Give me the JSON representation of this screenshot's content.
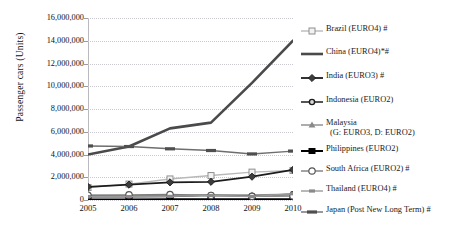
{
  "chart_data": {
    "type": "line",
    "title": "",
    "xlabel": "",
    "ylabel": "Passenger cars  (Units)",
    "x": [
      2005,
      2006,
      2007,
      2008,
      2009,
      2010
    ],
    "xtick_labels": [
      "2005",
      "2006",
      "2007",
      "2008",
      "2009",
      "2010"
    ],
    "ylim": [
      0,
      16000000
    ],
    "ytick_values": [
      0,
      2000000,
      4000000,
      6000000,
      8000000,
      10000000,
      12000000,
      14000000,
      16000000
    ],
    "ytick_labels": [
      "0",
      "2,000,000",
      "4,000,000",
      "6,000,000",
      "8,000,000",
      "10,000,000",
      "12,000,000",
      "14,000,000",
      "16,000,000"
    ],
    "grid": true,
    "legend_position": "right",
    "series": [
      {
        "name": "Brazil  (EURO4) #",
        "marker": "open-square",
        "color": "#b9b9b9",
        "line_width": 1.4,
        "values": [
          1100000,
          1400000,
          1850000,
          2150000,
          2450000,
          2600000
        ]
      },
      {
        "name": "China  (EURO4)*#",
        "marker": "none",
        "color": "#4a4a4a",
        "line_width": 2.6,
        "values": [
          4000000,
          4700000,
          6300000,
          6800000,
          10300000,
          14000000
        ]
      },
      {
        "name": "India (EURO3) #",
        "marker": "filled-diamond",
        "color": "#1c1c1c",
        "line_width": 1.8,
        "values": [
          1150000,
          1350000,
          1550000,
          1600000,
          2050000,
          2650000
        ]
      },
      {
        "name": "Indonesia (EURO2)",
        "marker": "open-circle-dark",
        "color": "#2b2b2b",
        "line_width": 1.6,
        "values": [
          280000,
          300000,
          320000,
          420000,
          350000,
          500000
        ]
      },
      {
        "name": "Malaysia",
        "name_line2": "(G: EURO3, D: EURO2)",
        "marker": "filled-triangle",
        "color": "#8a8a8a",
        "line_width": 1.4,
        "values": [
          400000,
          380000,
          400000,
          450000,
          450000,
          500000
        ]
      },
      {
        "name": "Philippines (EURO2)",
        "marker": "filled-square",
        "color": "#000000",
        "line_width": 2.0,
        "values": [
          40000,
          45000,
          55000,
          60000,
          60000,
          70000
        ]
      },
      {
        "name": "South Africa (EURO2) #",
        "marker": "open-circle",
        "color": "#7d7d7d",
        "line_width": 1.4,
        "values": [
          420000,
          450000,
          480000,
          400000,
          320000,
          350000
        ]
      },
      {
        "name": "Thailand (EURO4) #",
        "marker": "dash-small",
        "color": "#9a9a9a",
        "line_width": 1.4,
        "values": [
          300000,
          300000,
          320000,
          400000,
          310000,
          550000
        ]
      },
      {
        "name": "Japan (Post New Long Term) #",
        "marker": "dash-wide",
        "color": "#6e6e6e",
        "line_width": 1.4,
        "values": [
          4750000,
          4700000,
          4500000,
          4350000,
          4050000,
          4300000
        ]
      }
    ]
  },
  "legend": {
    "items": [
      {
        "label": "Brazil  (EURO4) #",
        "label2": ""
      },
      {
        "label": "China  (EURO4)*#",
        "label2": ""
      },
      {
        "label": "India (EURO3) #",
        "label2": ""
      },
      {
        "label": "Indonesia (EURO2)",
        "label2": ""
      },
      {
        "label": "Malaysia",
        "label2": "(G: EURO3, D: EURO2)"
      },
      {
        "label": "Philippines (EURO2)",
        "label2": ""
      },
      {
        "label": "South Africa (EURO2) #",
        "label2": ""
      },
      {
        "label": "Thailand (EURO4) #",
        "label2": ""
      },
      {
        "label": "Japan (Post New Long Term) #",
        "label2": ""
      }
    ]
  }
}
